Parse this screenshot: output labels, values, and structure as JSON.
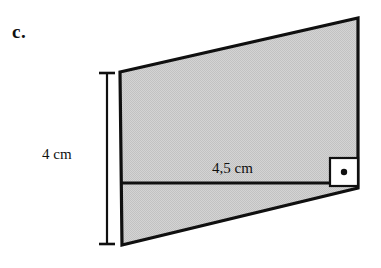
{
  "figure": {
    "item_label": "c.",
    "shape_type": "parallelogram",
    "fill_color": "#cfcfcf",
    "stroke_color": "#101010",
    "background_color": "#ffffff",
    "vertices": {
      "top_left": [
        120,
        72
      ],
      "top_right": [
        358,
        18
      ],
      "bottom_right": [
        358,
        188
      ],
      "bottom_left": [
        122,
        245
      ]
    },
    "base_line": {
      "label": "4,5 cm",
      "from": [
        121,
        183
      ],
      "to": [
        358,
        183
      ]
    },
    "height_dimension": {
      "label": "4 cm",
      "x": 107,
      "from_y": 72,
      "to_y": 245
    },
    "right_angle_marker": {
      "x": 330,
      "y": 158,
      "size": 28,
      "fill": "#ffffff",
      "dot_color": "#101010"
    }
  }
}
